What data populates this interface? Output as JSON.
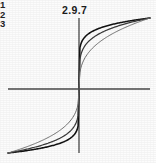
{
  "figure": {
    "number_label": "2.9.7",
    "caption_visible": false
  },
  "curve_key": {
    "items": [
      {
        "label": "1"
      },
      {
        "label": "2"
      },
      {
        "label": "3"
      }
    ]
  },
  "colors": {
    "background": "#fcfcfc",
    "axis": "#4a4a4a",
    "curve_1": "#111111",
    "curve_2": "#3a3a3a",
    "curve_3": "#6e6e6e",
    "text": "#1b1b1b"
  },
  "chart_data": {
    "type": "line",
    "title": "2.9.7",
    "xlabel": "",
    "ylabel": "",
    "xlim": [
      -1,
      1
    ],
    "ylim": [
      -1,
      1
    ],
    "grid": false,
    "legend": "inline-left-labels",
    "axes": {
      "x_axis_visible": true,
      "y_axis_visible": true,
      "origin": [
        0,
        0
      ],
      "tick_labels_x": [],
      "tick_labels_y": []
    },
    "series": [
      {
        "name": "1",
        "label": "1",
        "color": "#111111",
        "exponent": 0.125,
        "x": [
          -1.0,
          -0.8,
          -0.6,
          -0.4,
          -0.2,
          -0.1,
          -0.02,
          0,
          0.02,
          0.1,
          0.2,
          0.4,
          0.6,
          0.8,
          1.0
        ],
        "y": [
          -1.0,
          -0.972,
          -0.937,
          -0.891,
          -0.818,
          -0.75,
          -0.614,
          0,
          0.614,
          0.75,
          0.818,
          0.891,
          0.937,
          0.972,
          1.0
        ]
      },
      {
        "name": "2",
        "label": "2",
        "color": "#3a3a3a",
        "exponent": 0.2,
        "x": [
          -1.0,
          -0.8,
          -0.6,
          -0.4,
          -0.2,
          -0.1,
          -0.02,
          0,
          0.02,
          0.1,
          0.2,
          0.4,
          0.6,
          0.8,
          1.0
        ],
        "y": [
          -1.0,
          -0.956,
          -0.903,
          -0.833,
          -0.725,
          -0.631,
          -0.457,
          0,
          0.457,
          0.631,
          0.725,
          0.833,
          0.903,
          0.956,
          1.0
        ]
      },
      {
        "name": "3",
        "label": "3",
        "color": "#6e6e6e",
        "exponent": 0.333,
        "x": [
          -1.0,
          -0.8,
          -0.6,
          -0.4,
          -0.2,
          -0.1,
          -0.02,
          0,
          0.02,
          0.1,
          0.2,
          0.4,
          0.6,
          0.8,
          1.0
        ],
        "y": [
          -1.0,
          -0.928,
          -0.843,
          -0.737,
          -0.585,
          -0.464,
          -0.271,
          0,
          0.271,
          0.464,
          0.585,
          0.737,
          0.843,
          0.928,
          1.0
        ]
      }
    ]
  }
}
